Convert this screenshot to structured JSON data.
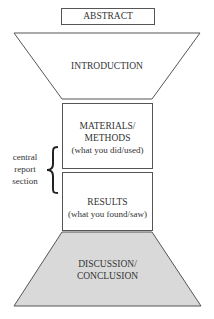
{
  "diagram": {
    "abstract": {
      "label": "ABSTRACT"
    },
    "introduction": {
      "label": "INTRODUCTION"
    },
    "materials_methods": {
      "line1": "MATERIALS/",
      "line2": "METHODS",
      "note": "(what you did/used)"
    },
    "results": {
      "line1": "RESULTS",
      "note": "(what you found/saw)"
    },
    "discussion": {
      "line1": "DISCUSSION/",
      "line2": "CONCLUSION"
    },
    "central_section": {
      "line1": "central",
      "line2": "report",
      "line3": "section"
    },
    "colors": {
      "stroke": "#555555",
      "discussion_fill": "#d9d9d9",
      "background": "#ffffff"
    }
  }
}
